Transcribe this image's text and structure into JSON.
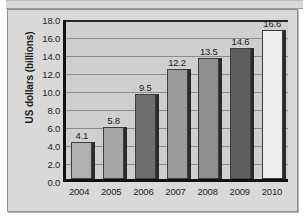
{
  "chart_data": {
    "type": "bar",
    "title": "",
    "xlabel": "",
    "ylabel": "US dollars (billions)",
    "categories": [
      "2004",
      "2005",
      "2006",
      "2007",
      "2008",
      "2009",
      "2010"
    ],
    "values": [
      4.1,
      5.8,
      9.5,
      12.2,
      13.5,
      14.6,
      16.6
    ],
    "data_labels": [
      "4.1",
      "5.8",
      "9.5",
      "12.2",
      "13.5",
      "14.6",
      "16.6"
    ],
    "bar_colors": [
      "#b0b0b0",
      "#a8a8a8",
      "#6f6f6f",
      "#9a9a9a",
      "#8f8f8f",
      "#5e5e5e",
      "#ededed"
    ],
    "ylim": [
      0.0,
      18.0
    ],
    "ytick_labels": [
      "18.0",
      "16.0",
      "14.0",
      "12.0",
      "10.0",
      "8.0",
      "6.0",
      "4.0",
      "2.0",
      "0.0"
    ],
    "ytick_values": [
      18.0,
      16.0,
      14.0,
      12.0,
      10.0,
      8.0,
      6.0,
      4.0,
      2.0,
      0.0
    ],
    "ytick_step": 2.0,
    "grid": true,
    "legend": false,
    "plot_background": "#cfcfcf",
    "figure_background": "#d9d9d9",
    "axis_color": "#111111"
  }
}
